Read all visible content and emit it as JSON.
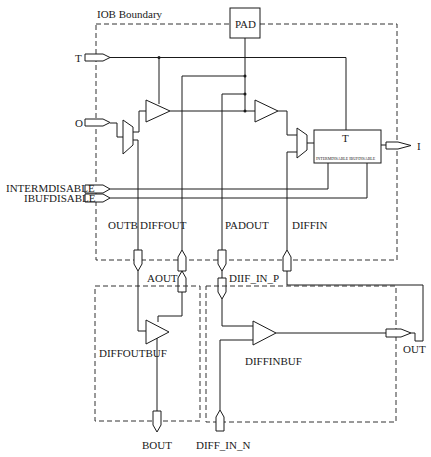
{
  "diagram": {
    "title": "IOB Boundary",
    "blocks": {
      "pad": "PAD",
      "register_top": "T",
      "register_bottom": "INTERMDISABLE IBUFDISABLE",
      "diffoutbuf": "DIFFOUTBUF",
      "diffinbuf": "DIFFINBUF"
    },
    "ports": {
      "t": "T",
      "o": "O",
      "i": "I",
      "intermdisable": "INTERMDISABLE",
      "ibufdisable": "IBUFDISABLE",
      "outb": "OUTB",
      "diffout": "DIFFOUT",
      "padout": "PADOUT",
      "diffin": "DIFFIN",
      "aout": "AOUT",
      "diff_in_p": "DIIF_IN_P",
      "out": "OUT",
      "bout": "BOUT",
      "diff_in_n": "DIFF_IN_N"
    }
  }
}
